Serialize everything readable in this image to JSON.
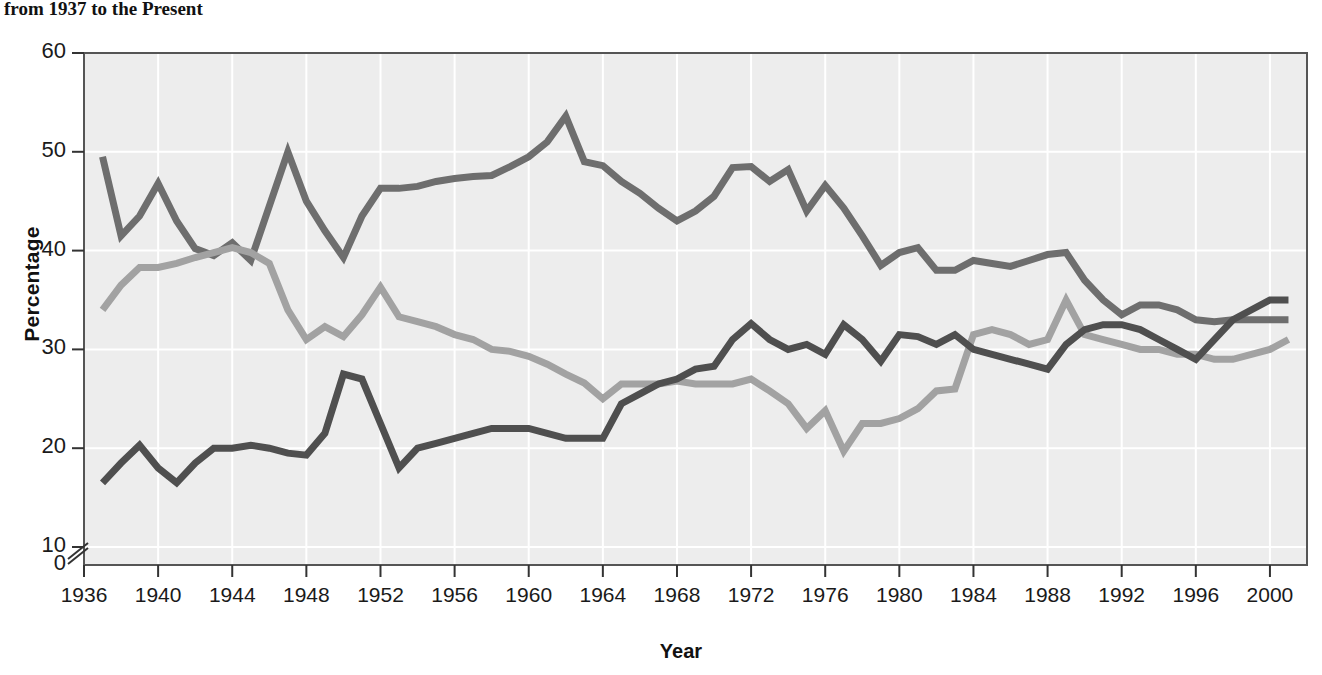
{
  "caption": {
    "text": "from 1937 to the Present"
  },
  "chart_data": {
    "type": "line",
    "title": "from 1937 to the Present",
    "xlabel": "Year",
    "ylabel": "Percentage",
    "xlim": [
      1936,
      2002
    ],
    "ylim": [
      0,
      60
    ],
    "y_axis_break": true,
    "grid": true,
    "grid_color": "#ffffff",
    "plot_background": "#ededed",
    "y_ticks": [
      0,
      10,
      20,
      30,
      40,
      50,
      60
    ],
    "x_ticks": [
      1936,
      1940,
      1944,
      1948,
      1952,
      1956,
      1960,
      1964,
      1968,
      1972,
      1976,
      1980,
      1984,
      1988,
      1992,
      1996,
      2000
    ],
    "legend_position": "inline-annotations",
    "series": [
      {
        "name": "Democrat",
        "color": "#6e6e6e",
        "end_label": "33%",
        "end_value": 33,
        "label_x": 1965,
        "label_y": 53.5,
        "points": [
          [
            1937,
            49.5
          ],
          [
            1938,
            41.5
          ],
          [
            1939,
            43.5
          ],
          [
            1940,
            46.8
          ],
          [
            1941,
            43.0
          ],
          [
            1942,
            40.2
          ],
          [
            1943,
            39.5
          ],
          [
            1944,
            40.8
          ],
          [
            1945,
            39.0
          ],
          [
            1946,
            44.5
          ],
          [
            1947,
            50.0
          ],
          [
            1948,
            45.0
          ],
          [
            1949,
            42.0
          ],
          [
            1950,
            39.3
          ],
          [
            1951,
            43.5
          ],
          [
            1952,
            46.3
          ],
          [
            1953,
            46.3
          ],
          [
            1954,
            46.5
          ],
          [
            1955,
            47.0
          ],
          [
            1956,
            47.3
          ],
          [
            1957,
            47.5
          ],
          [
            1958,
            47.6
          ],
          [
            1959,
            48.5
          ],
          [
            1960,
            49.5
          ],
          [
            1961,
            51.0
          ],
          [
            1962,
            53.6
          ],
          [
            1963,
            49.0
          ],
          [
            1964,
            48.6
          ],
          [
            1965,
            47.0
          ],
          [
            1966,
            45.8
          ],
          [
            1967,
            44.3
          ],
          [
            1968,
            43.0
          ],
          [
            1969,
            44.0
          ],
          [
            1970,
            45.5
          ],
          [
            1971,
            48.4
          ],
          [
            1972,
            48.5
          ],
          [
            1973,
            47.0
          ],
          [
            1974,
            48.2
          ],
          [
            1975,
            44.0
          ],
          [
            1976,
            46.6
          ],
          [
            1977,
            44.3
          ],
          [
            1978,
            41.5
          ],
          [
            1979,
            38.5
          ],
          [
            1980,
            39.8
          ],
          [
            1981,
            40.3
          ],
          [
            1982,
            38.0
          ],
          [
            1983,
            38.0
          ],
          [
            1984,
            39.0
          ],
          [
            1985,
            38.7
          ],
          [
            1986,
            38.4
          ],
          [
            1987,
            39.0
          ],
          [
            1988,
            39.6
          ],
          [
            1989,
            39.8
          ],
          [
            1990,
            37.0
          ],
          [
            1991,
            35.0
          ],
          [
            1992,
            33.5
          ],
          [
            1993,
            34.5
          ],
          [
            1994,
            34.5
          ],
          [
            1995,
            34.0
          ],
          [
            1996,
            33.0
          ],
          [
            1997,
            32.8
          ],
          [
            1998,
            33.0
          ],
          [
            2000,
            33.0
          ],
          [
            2001,
            33.0
          ]
        ]
      },
      {
        "name": "Republican",
        "color": "#a2a2a2",
        "end_label": "31%",
        "end_value": 31,
        "label_x": 1951,
        "label_y": 36.5,
        "points": [
          [
            1937,
            34.0
          ],
          [
            1938,
            36.5
          ],
          [
            1939,
            38.3
          ],
          [
            1940,
            38.3
          ],
          [
            1941,
            38.7
          ],
          [
            1942,
            39.3
          ],
          [
            1943,
            39.8
          ],
          [
            1944,
            40.3
          ],
          [
            1945,
            39.8
          ],
          [
            1946,
            38.7
          ],
          [
            1947,
            34.0
          ],
          [
            1948,
            31.0
          ],
          [
            1949,
            32.3
          ],
          [
            1950,
            31.3
          ],
          [
            1951,
            33.5
          ],
          [
            1952,
            36.3
          ],
          [
            1953,
            33.3
          ],
          [
            1954,
            32.8
          ],
          [
            1955,
            32.3
          ],
          [
            1956,
            31.5
          ],
          [
            1957,
            31.0
          ],
          [
            1958,
            30.0
          ],
          [
            1959,
            29.8
          ],
          [
            1960,
            29.3
          ],
          [
            1961,
            28.5
          ],
          [
            1962,
            27.5
          ],
          [
            1963,
            26.6
          ],
          [
            1964,
            25.0
          ],
          [
            1965,
            26.5
          ],
          [
            1966,
            26.5
          ],
          [
            1967,
            26.5
          ],
          [
            1968,
            26.8
          ],
          [
            1969,
            26.5
          ],
          [
            1970,
            26.5
          ],
          [
            1971,
            26.5
          ],
          [
            1972,
            27.0
          ],
          [
            1973,
            25.8
          ],
          [
            1974,
            24.5
          ],
          [
            1975,
            22.0
          ],
          [
            1976,
            23.8
          ],
          [
            1977,
            19.7
          ],
          [
            1978,
            22.5
          ],
          [
            1979,
            22.5
          ],
          [
            1980,
            23.0
          ],
          [
            1981,
            24.0
          ],
          [
            1982,
            25.8
          ],
          [
            1983,
            26.0
          ],
          [
            1984,
            31.5
          ],
          [
            1985,
            32.0
          ],
          [
            1986,
            31.5
          ],
          [
            1987,
            30.5
          ],
          [
            1988,
            31.0
          ],
          [
            1989,
            35.0
          ],
          [
            1990,
            31.5
          ],
          [
            1991,
            31.0
          ],
          [
            1992,
            30.5
          ],
          [
            1993,
            30.0
          ],
          [
            1994,
            30.0
          ],
          [
            1995,
            29.5
          ],
          [
            1996,
            29.5
          ],
          [
            1997,
            29.0
          ],
          [
            1998,
            29.0
          ],
          [
            2000,
            30.0
          ],
          [
            2001,
            31.0
          ]
        ]
      },
      {
        "name": "Independent",
        "color": "#4f4f4f",
        "end_label": "35%",
        "end_value": 35,
        "label_x": 1950,
        "label_y": 24.0,
        "points": [
          [
            1937,
            16.5
          ],
          [
            1938,
            18.5
          ],
          [
            1939,
            20.3
          ],
          [
            1940,
            18.0
          ],
          [
            1941,
            16.5
          ],
          [
            1942,
            18.5
          ],
          [
            1943,
            20.0
          ],
          [
            1944,
            20.0
          ],
          [
            1945,
            20.3
          ],
          [
            1946,
            20.0
          ],
          [
            1947,
            19.5
          ],
          [
            1948,
            19.3
          ],
          [
            1949,
            21.5
          ],
          [
            1950,
            27.5
          ],
          [
            1951,
            27.0
          ],
          [
            1952,
            22.5
          ],
          [
            1953,
            18.0
          ],
          [
            1954,
            20.0
          ],
          [
            1955,
            20.5
          ],
          [
            1956,
            21.0
          ],
          [
            1957,
            21.5
          ],
          [
            1958,
            22.0
          ],
          [
            1959,
            22.0
          ],
          [
            1960,
            22.0
          ],
          [
            1961,
            21.5
          ],
          [
            1962,
            21.0
          ],
          [
            1963,
            21.0
          ],
          [
            1964,
            21.0
          ],
          [
            1965,
            24.5
          ],
          [
            1966,
            25.5
          ],
          [
            1967,
            26.5
          ],
          [
            1968,
            27.0
          ],
          [
            1969,
            28.0
          ],
          [
            1970,
            28.3
          ],
          [
            1971,
            31.0
          ],
          [
            1972,
            32.6
          ],
          [
            1973,
            31.0
          ],
          [
            1974,
            30.0
          ],
          [
            1975,
            30.5
          ],
          [
            1976,
            29.5
          ],
          [
            1977,
            32.5
          ],
          [
            1978,
            31.0
          ],
          [
            1979,
            28.8
          ],
          [
            1980,
            31.5
          ],
          [
            1981,
            31.3
          ],
          [
            1982,
            30.5
          ],
          [
            1983,
            31.5
          ],
          [
            1984,
            30.0
          ],
          [
            1985,
            29.5
          ],
          [
            1986,
            29.0
          ],
          [
            1987,
            28.5
          ],
          [
            1988,
            28.0
          ],
          [
            1989,
            30.5
          ],
          [
            1990,
            32.0
          ],
          [
            1991,
            32.5
          ],
          [
            1992,
            32.5
          ],
          [
            1993,
            32.0
          ],
          [
            1994,
            31.0
          ],
          [
            1995,
            30.0
          ],
          [
            1996,
            29.0
          ],
          [
            1997,
            31.0
          ],
          [
            1998,
            33.0
          ],
          [
            2000,
            35.0
          ],
          [
            2001,
            35.0
          ]
        ]
      }
    ]
  }
}
